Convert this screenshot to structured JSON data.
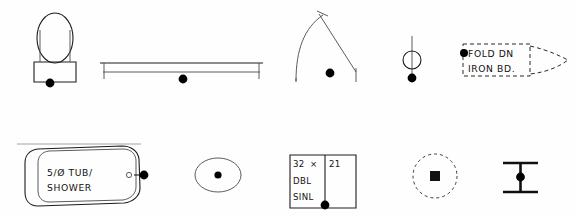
{
  "sheet": {
    "title": "Architectural Fixture Symbol Legend",
    "background_color": "#fefefe",
    "line_color": "#1c1c1c",
    "marker_color": "#000000",
    "width": 575,
    "height": 216
  },
  "symbols": {
    "toilet": {
      "name": "water-closet-symbol",
      "label": ""
    },
    "shelf_rod": {
      "name": "shelf-and-rod-symbol",
      "label": ""
    },
    "door_swing": {
      "name": "door-swing-symbol",
      "label": ""
    },
    "pole_circle": {
      "name": "pole-circle-symbol",
      "label": ""
    },
    "fold_down": {
      "name": "fold-down-ironing-board-symbol",
      "line1": "FOLD DN",
      "line2": "IRON BD."
    },
    "tub_shower": {
      "name": "tub-shower-symbol",
      "line1": "5/Ø TUB/",
      "line2": "SHOWER"
    },
    "lavatory": {
      "name": "oval-lavatory-symbol",
      "label": ""
    },
    "double_sink": {
      "name": "double-sink-symbol",
      "size_width": "32",
      "size_separator": "×",
      "size_depth": "21",
      "line2": "DBL",
      "line3": "SINL"
    },
    "ceiling_fixture": {
      "name": "ceiling-fixture-symbol",
      "label": ""
    },
    "beam": {
      "name": "beam-section-symbol",
      "label": ""
    }
  }
}
